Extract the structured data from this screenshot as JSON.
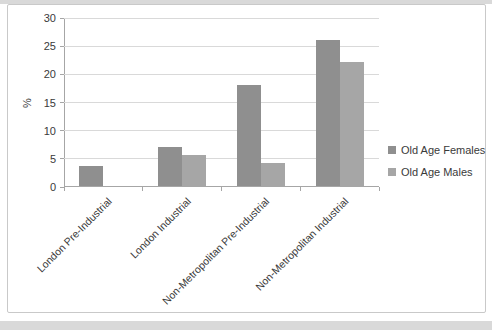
{
  "page": {
    "background_color": "#ffffff",
    "edge_band_color": "#d9d9d9",
    "card_border_color": "#c9c9c9"
  },
  "chart_data": {
    "type": "bar",
    "title": "",
    "categories": [
      "London Pre-Industrial",
      "London Industrial",
      "Non-Metropolitan Pre-Industrial",
      "Non-Metropolitan Industrial"
    ],
    "series": [
      {
        "name": "Old Age Females",
        "values": [
          3.5,
          7,
          18,
          26
        ],
        "color": "#8f8f8f"
      },
      {
        "name": "Old Age Males",
        "values": [
          0,
          5.5,
          4,
          22
        ],
        "color": "#a6a6a6"
      }
    ],
    "xlabel": "",
    "ylabel": "%",
    "ylim": [
      0,
      30
    ],
    "yticks": [
      0,
      5,
      10,
      15,
      20,
      25,
      30
    ],
    "grid": true,
    "legend_position": "right",
    "gridline_color": "#d9d9d9",
    "axis_color": "#a6a6a6",
    "text_color": "#3a3a3a"
  }
}
